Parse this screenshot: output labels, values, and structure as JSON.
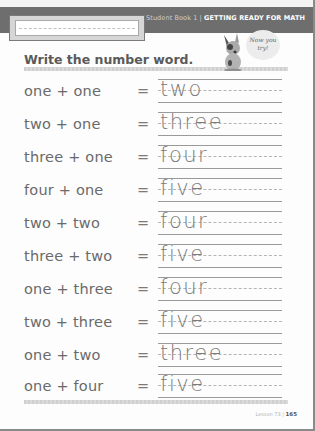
{
  "header": {
    "book_label": "Student Book 1 |",
    "section_title": "GETTING READY FOR MATH",
    "name_box_placeholder": ""
  },
  "title": "Write the number word.",
  "mascot": {
    "icon": "dog-mascot-icon",
    "bubble_line1": "Now you",
    "bubble_line2": "try!"
  },
  "rows": [
    {
      "expression": "one + one",
      "equals": "=",
      "answer": "two"
    },
    {
      "expression": "two + one",
      "equals": "=",
      "answer": "three"
    },
    {
      "expression": "three + one",
      "equals": "=",
      "answer": "four"
    },
    {
      "expression": "four + one",
      "equals": "=",
      "answer": "five"
    },
    {
      "expression": "two + two",
      "equals": "=",
      "answer": "four"
    },
    {
      "expression": "three + two",
      "equals": "=",
      "answer": "five"
    },
    {
      "expression": "one + three",
      "equals": "=",
      "answer": "four"
    },
    {
      "expression": "two + three",
      "equals": "=",
      "answer": "five"
    },
    {
      "expression": "one + two",
      "equals": "=",
      "answer": "three"
    },
    {
      "expression": "one + four",
      "equals": "=",
      "answer": "five"
    }
  ],
  "footer": {
    "lesson": "Lesson 73 |",
    "page_number": "165"
  },
  "colors": {
    "header_bar": "#6e6e6e",
    "title_text": "#5a5a5a",
    "body_text": "#6a6a6a"
  }
}
